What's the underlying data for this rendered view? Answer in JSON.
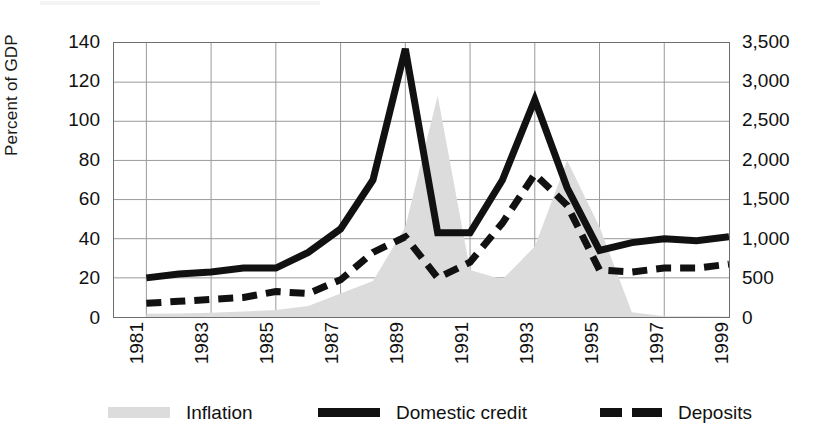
{
  "chart_data": {
    "type": "area",
    "title": "",
    "subtitle": "",
    "xlabel": "",
    "ylabel": "Percent of GDP",
    "y2label": "",
    "grid": true,
    "legend_position": "bottom",
    "x": [
      1982,
      1983,
      1984,
      1985,
      1986,
      1987,
      1988,
      1989,
      1990,
      1991,
      1992,
      1993,
      1994,
      1995,
      1996,
      1997,
      1998,
      1999,
      2000
    ],
    "xlim": [
      1981,
      2000
    ],
    "ylim": [
      0,
      140
    ],
    "y2lim": [
      0,
      3500
    ],
    "yticks": [
      0,
      20,
      40,
      60,
      80,
      100,
      120,
      140
    ],
    "y2ticks": [
      "0",
      "500",
      "1,000",
      "1,500",
      "2,000",
      "2,500",
      "3,000",
      "3,500"
    ],
    "xticks": [
      "1981",
      "1983",
      "1985",
      "1987",
      "1989",
      "1991",
      "1993",
      "1995",
      "1997",
      "1999"
    ],
    "series": [
      {
        "name": "Inflation",
        "type": "area",
        "axis": "right",
        "color": "#dcdcdc",
        "values": [
          40,
          45,
          55,
          70,
          90,
          140,
          300,
          460,
          1150,
          2825,
          600,
          480,
          900,
          2000,
          1150,
          60,
          10,
          8,
          6
        ]
      },
      {
        "name": "Domestic credit",
        "type": "line",
        "style": "solid",
        "axis": "left",
        "color": "#111111",
        "values": [
          20,
          22,
          23,
          25,
          25,
          33,
          45,
          70,
          137,
          43,
          43,
          70,
          111,
          66,
          34,
          38,
          40,
          39,
          41
        ]
      },
      {
        "name": "Deposits",
        "type": "line",
        "style": "dashed",
        "axis": "left",
        "color": "#111111",
        "values": [
          7,
          8,
          9,
          10,
          13,
          12,
          19,
          33,
          41,
          20,
          28,
          48,
          73,
          57,
          24,
          23,
          25,
          25,
          27
        ]
      }
    ]
  },
  "axes": {
    "left_title": "Percent of GDP",
    "left_ticks": [
      "140",
      "120",
      "100",
      "80",
      "60",
      "40",
      "20",
      "0"
    ],
    "right_ticks": [
      "3,500",
      "3,000",
      "2,500",
      "2,000",
      "1,500",
      "1,000",
      "500",
      "0"
    ],
    "x_ticks": [
      "1981",
      "1983",
      "1985",
      "1987",
      "1989",
      "1991",
      "1993",
      "1995",
      "1997",
      "1999"
    ]
  },
  "legend": {
    "items": [
      {
        "label": "Inflation",
        "swatch": "area-swatch"
      },
      {
        "label": "Domestic credit",
        "swatch": "solid-line-swatch"
      },
      {
        "label": "Deposits",
        "swatch": "dashed-line-swatch"
      }
    ]
  },
  "colors": {
    "area": "#dcdcdc",
    "line": "#111111",
    "grid": "#9a9a9a",
    "frame": "#6e6e6e",
    "background": "#ffffff"
  }
}
